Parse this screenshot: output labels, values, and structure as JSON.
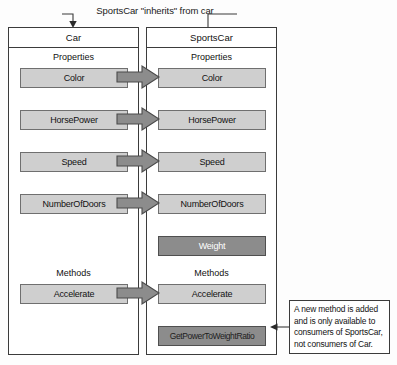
{
  "diagram": {
    "caption": "SportsCar \"inherits\" from car",
    "base_class": {
      "title": "Car",
      "properties_label": "Properties",
      "methods_label": "Methods",
      "properties": [
        {
          "name": "Color"
        },
        {
          "name": "HorsePower"
        },
        {
          "name": "Speed"
        },
        {
          "name": "NumberOfDoors"
        }
      ],
      "methods": [
        {
          "name": "Accelerate"
        }
      ]
    },
    "derived_class": {
      "title": "SportsCar",
      "properties_label": "Properties",
      "methods_label": "Methods",
      "properties": [
        {
          "name": "Color",
          "inherited": true
        },
        {
          "name": "HorsePower",
          "inherited": true
        },
        {
          "name": "Speed",
          "inherited": true
        },
        {
          "name": "NumberOfDoors",
          "inherited": true
        },
        {
          "name": "Weight",
          "inherited": false
        }
      ],
      "methods": [
        {
          "name": "Accelerate",
          "inherited": true
        },
        {
          "name": "GetPowerToWeightRatio",
          "inherited": false
        }
      ]
    },
    "callout": {
      "lines": [
        "A new method is added",
        "and is only available to",
        "consumers of SportsCar,",
        "not consumers of Car."
      ]
    },
    "colors": {
      "inherited_fill": "#cfcfcf",
      "new_member_fill": "#8c8c8c",
      "arrow_fill": "#8c8c8c",
      "outline": "#3b3b3b",
      "background": "#ffffff"
    }
  }
}
